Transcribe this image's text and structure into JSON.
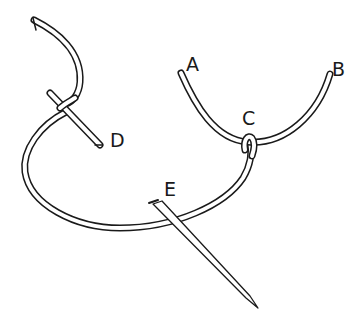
{
  "diagram": {
    "stroke_color": "#1a1a1a",
    "background": "#ffffff",
    "labels": [
      {
        "id": "A",
        "text": "A",
        "x": 186,
        "y": 55
      },
      {
        "id": "B",
        "text": "B",
        "x": 332,
        "y": 60
      },
      {
        "id": "C",
        "text": "C",
        "x": 242,
        "y": 109
      },
      {
        "id": "D",
        "text": "D",
        "x": 110,
        "y": 131
      },
      {
        "id": "E",
        "text": "E",
        "x": 164,
        "y": 180
      }
    ]
  }
}
